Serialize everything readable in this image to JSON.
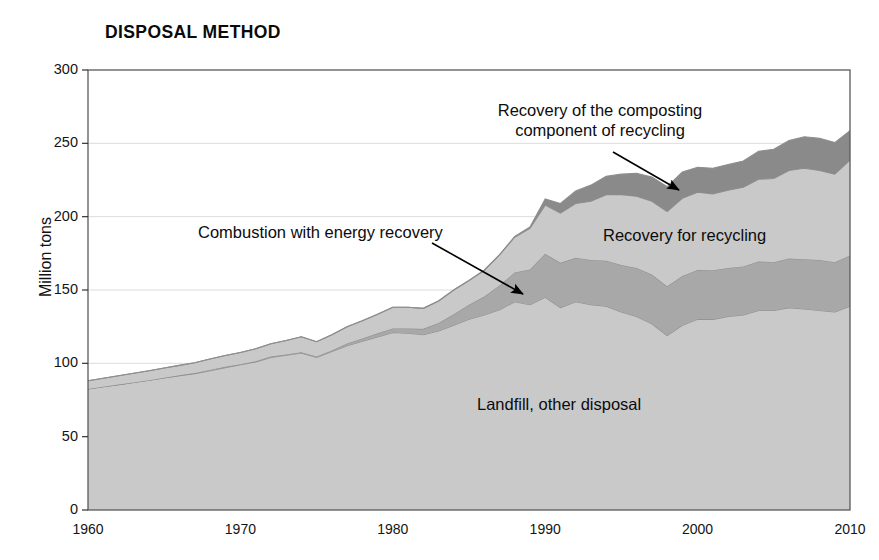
{
  "chart_data": {
    "type": "area",
    "title": "DISPOSAL METHOD",
    "xlabel": "",
    "ylabel": "Million tons",
    "xlim": [
      1960,
      2010
    ],
    "ylim": [
      0,
      300
    ],
    "grid": true,
    "stacked": true,
    "legend_position": "inline-annotations",
    "xticks": [
      "1960",
      "1970",
      "1980",
      "1990",
      "2000",
      "2010"
    ],
    "yticks": [
      "0",
      "50",
      "100",
      "150",
      "200",
      "250",
      "300"
    ],
    "x": [
      1960,
      1961,
      1962,
      1963,
      1964,
      1965,
      1966,
      1967,
      1968,
      1969,
      1970,
      1971,
      1972,
      1973,
      1974,
      1975,
      1976,
      1977,
      1978,
      1979,
      1980,
      1981,
      1982,
      1983,
      1984,
      1985,
      1986,
      1987,
      1988,
      1989,
      1990,
      1991,
      1992,
      1993,
      1994,
      1995,
      1996,
      1997,
      1998,
      1999,
      2000,
      2001,
      2002,
      2003,
      2004,
      2005,
      2006,
      2007,
      2008,
      2009,
      2010
    ],
    "series": [
      {
        "name": "Landfill, other disposal",
        "color": "#c9c9c9",
        "values": [
          82.5,
          84.0,
          85.5,
          87.0,
          88.5,
          90.0,
          91.5,
          93.0,
          95.0,
          97.0,
          99.0,
          101.0,
          104.0,
          105.5,
          107.0,
          104.0,
          108.0,
          112.0,
          115.0,
          118.0,
          121.0,
          120.5,
          119.5,
          122.0,
          126.0,
          130.0,
          133.0,
          136.5,
          142.0,
          140.0,
          145.0,
          138.0,
          142.0,
          140.0,
          139.0,
          135.0,
          132.0,
          127.0,
          119.0,
          126.0,
          130.0,
          130.0,
          132.0,
          133.0,
          136.0,
          136.0,
          138.0,
          137.0,
          136.0,
          135.0,
          139.0
        ]
      },
      {
        "name": "Combustion with energy recovery",
        "color": "#a8a8a8",
        "values": [
          0.0,
          0.0,
          0.0,
          0.0,
          0.0,
          0.2,
          0.3,
          0.4,
          0.5,
          0.6,
          0.4,
          0.5,
          0.6,
          0.6,
          0.6,
          0.7,
          0.7,
          1.5,
          2.0,
          2.5,
          2.7,
          3.2,
          4.0,
          5.5,
          7.5,
          10.0,
          12.5,
          16.5,
          20.0,
          24.0,
          29.7,
          30.5,
          30.0,
          30.5,
          31.0,
          32.0,
          33.0,
          33.5,
          33.5,
          33.5,
          33.7,
          33.5,
          33.0,
          33.0,
          33.5,
          33.0,
          33.5,
          34.0,
          34.5,
          34.0,
          34.5
        ]
      },
      {
        "name": "Recovery for recycling",
        "color": "#c9c9c9",
        "values": [
          5.6,
          5.8,
          6.0,
          6.2,
          6.4,
          6.6,
          6.8,
          7.0,
          7.4,
          7.8,
          8.0,
          8.4,
          8.8,
          9.5,
          10.5,
          10.0,
          10.8,
          11.5,
          12.0,
          13.0,
          14.5,
          14.5,
          14.0,
          15.0,
          16.5,
          16.5,
          18.0,
          21.0,
          24.0,
          28.0,
          33.2,
          34.0,
          37.0,
          40.0,
          45.0,
          48.0,
          49.0,
          50.0,
          51.0,
          53.0,
          53.0,
          52.0,
          53.0,
          54.0,
          56.0,
          57.0,
          60.0,
          62.0,
          61.0,
          60.0,
          65.0
        ]
      },
      {
        "name": "Recovery of the composting component of recycling",
        "color": "#8a8a8a",
        "values": [
          0.0,
          0.0,
          0.0,
          0.0,
          0.0,
          0.0,
          0.0,
          0.0,
          0.0,
          0.0,
          0.0,
          0.0,
          0.0,
          0.0,
          0.0,
          0.0,
          0.0,
          0.0,
          0.0,
          0.0,
          0.0,
          0.0,
          0.0,
          0.0,
          0.0,
          0.0,
          0.0,
          0.0,
          0.5,
          1.0,
          4.2,
          6.5,
          8.5,
          11.0,
          12.5,
          14.0,
          15.5,
          16.5,
          17.0,
          18.0,
          17.0,
          17.5,
          17.5,
          18.0,
          19.0,
          20.0,
          20.5,
          21.5,
          22.0,
          21.5,
          20.2
        ]
      }
    ],
    "annotations": [
      {
        "name": "composting-annotation",
        "line1": "Recovery of the composting",
        "line2": "component of recycling",
        "arrow_from": [
          613,
          152
        ],
        "arrow_to": [
          679,
          190
        ]
      },
      {
        "name": "combustion-annotation",
        "line1": "Combustion with energy recovery",
        "line2": "",
        "arrow_from": [
          432,
          243
        ],
        "arrow_to": [
          523,
          294
        ]
      }
    ],
    "inline_labels": [
      {
        "name": "recycling-label",
        "text": "Recovery for recycling",
        "x": 603,
        "y": 226
      },
      {
        "name": "landfill-label",
        "text": "Landfill, other disposal",
        "x": 477,
        "y": 395
      }
    ]
  },
  "colors": {
    "landfill": "#c9c9c9",
    "combustion": "#a8a8a8",
    "recycling": "#c9c9c9",
    "composting": "#8a8a8a",
    "axis": "#5a5a5a",
    "grid": "#d8d8d8",
    "text": "#0c0c0c"
  }
}
